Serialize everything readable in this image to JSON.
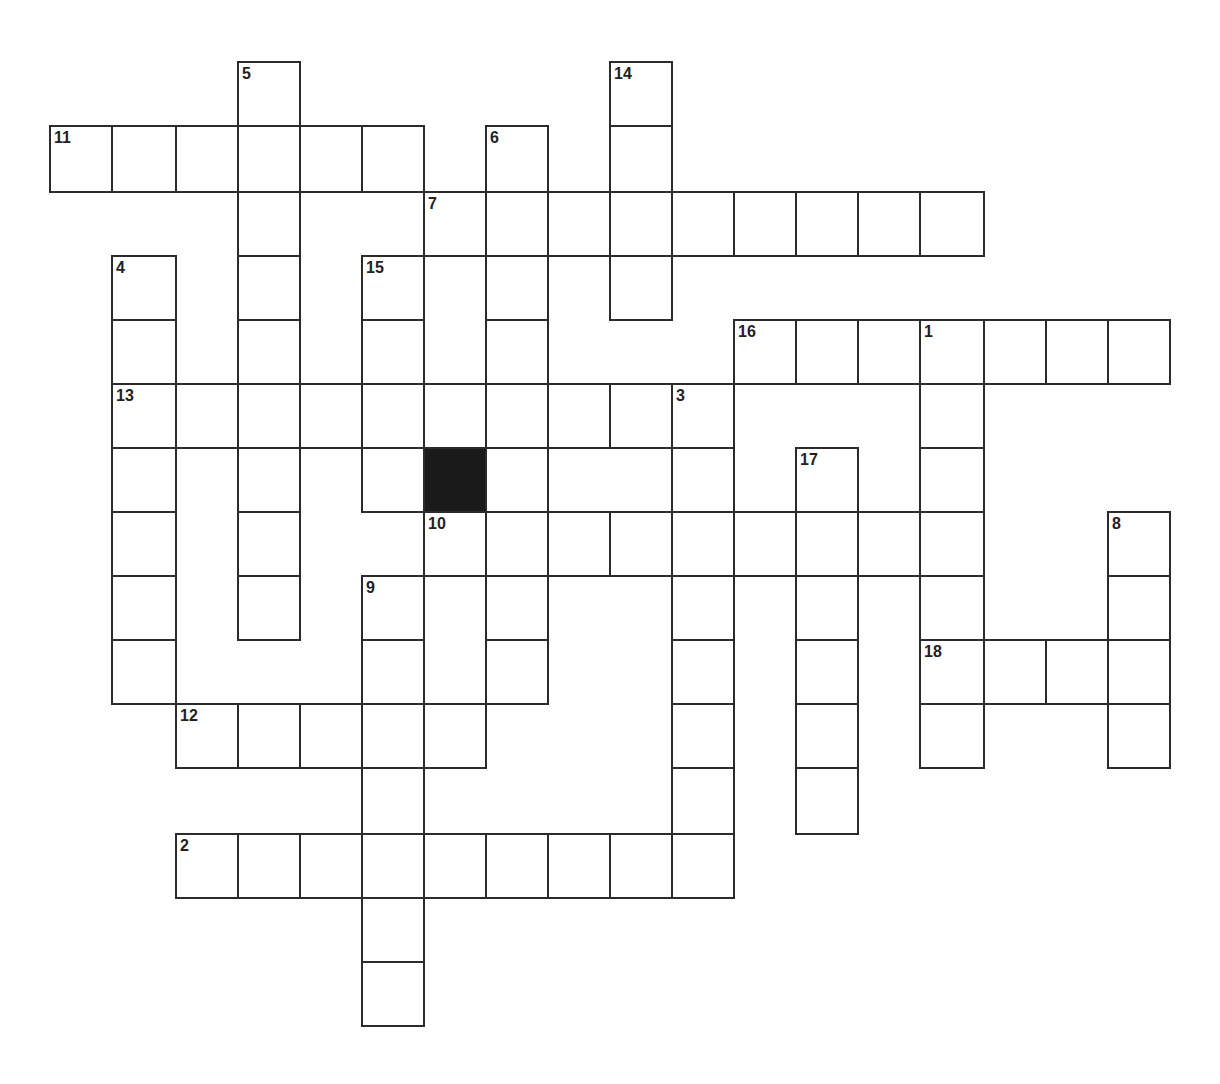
{
  "puzzle": {
    "type": "crossword",
    "cell_colors": {
      "border": "#2b2b2b",
      "fill": "#ffffff",
      "block": "#1a1a1a"
    },
    "columns_x": [
      50,
      112,
      176,
      238,
      300,
      362,
      424,
      486,
      548,
      610,
      672,
      734,
      796,
      858,
      920,
      984,
      1046,
      1108,
      1170
    ],
    "rows_y": [
      62,
      126,
      192,
      256,
      320,
      384,
      448,
      512,
      576,
      640,
      704,
      768,
      834,
      898,
      962,
      1026
    ],
    "entries": [
      {
        "number": "11",
        "direction": "across",
        "row": 1,
        "col": 0,
        "length": 6
      },
      {
        "number": "7",
        "direction": "across",
        "row": 2,
        "col": 6,
        "length": 9
      },
      {
        "number": "16",
        "direction": "across",
        "row": 4,
        "col": 11,
        "length": 7
      },
      {
        "number": "13",
        "direction": "across",
        "row": 5,
        "col": 1,
        "length": 10
      },
      {
        "number": "10",
        "direction": "across",
        "row": 7,
        "col": 6,
        "length": 9
      },
      {
        "number": "18",
        "direction": "across",
        "row": 9,
        "col": 14,
        "length": 4
      },
      {
        "number": "12",
        "direction": "across",
        "row": 10,
        "col": 2,
        "length": 5
      },
      {
        "number": "2",
        "direction": "across",
        "row": 12,
        "col": 2,
        "length": 9
      },
      {
        "number": "5",
        "direction": "down",
        "row": 0,
        "col": 3,
        "length": 9
      },
      {
        "number": "14",
        "direction": "down",
        "row": 0,
        "col": 9,
        "length": 4
      },
      {
        "number": "6",
        "direction": "down",
        "row": 1,
        "col": 7,
        "length": 9
      },
      {
        "number": "4",
        "direction": "down",
        "row": 3,
        "col": 1,
        "length": 7
      },
      {
        "number": "15",
        "direction": "down",
        "row": 3,
        "col": 5,
        "length": 4
      },
      {
        "number": "1",
        "direction": "down",
        "row": 4,
        "col": 14,
        "length": 7
      },
      {
        "number": "3",
        "direction": "down",
        "row": 5,
        "col": 10,
        "length": 8
      },
      {
        "number": "17",
        "direction": "down",
        "row": 6,
        "col": 12,
        "length": 6
      },
      {
        "number": "8",
        "direction": "down",
        "row": 7,
        "col": 17,
        "length": 4
      },
      {
        "number": "9",
        "direction": "down",
        "row": 8,
        "col": 5,
        "length": 7
      }
    ],
    "blocks": [
      {
        "row": 6,
        "col": 6
      }
    ]
  }
}
